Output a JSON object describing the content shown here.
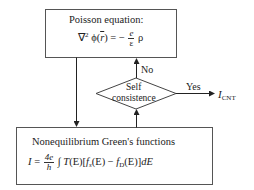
{
  "diagram": {
    "poisson_box": {
      "title": "Poisson equation:",
      "equation": {
        "lhs": "∇",
        "lhs_sup": "2",
        "phi": "ϕ(",
        "rvec": "r",
        "rhs_mid": ") = −",
        "frac_num": "e",
        "frac_den": "ε",
        "rho": "ρ"
      }
    },
    "decision": {
      "line1": "Self",
      "line2": "consistence",
      "no_label": "No",
      "yes_label": "Yes"
    },
    "output": {
      "symbol": "I",
      "subscript": "CNT"
    },
    "negf_box": {
      "title": "Nonequilibrium Green's functions",
      "equation": {
        "lhs": "I",
        "eq": "=",
        "frac_num": "4e",
        "frac_den": "h",
        "integral": "∫",
        "body1": "T",
        "body2": "(E)[",
        "fs": "f",
        "fs_sub": "s",
        "body3": "(E) −",
        "fd": "f",
        "fd_sub": "D",
        "body4": "(E)]",
        "dE": "dE"
      }
    }
  }
}
